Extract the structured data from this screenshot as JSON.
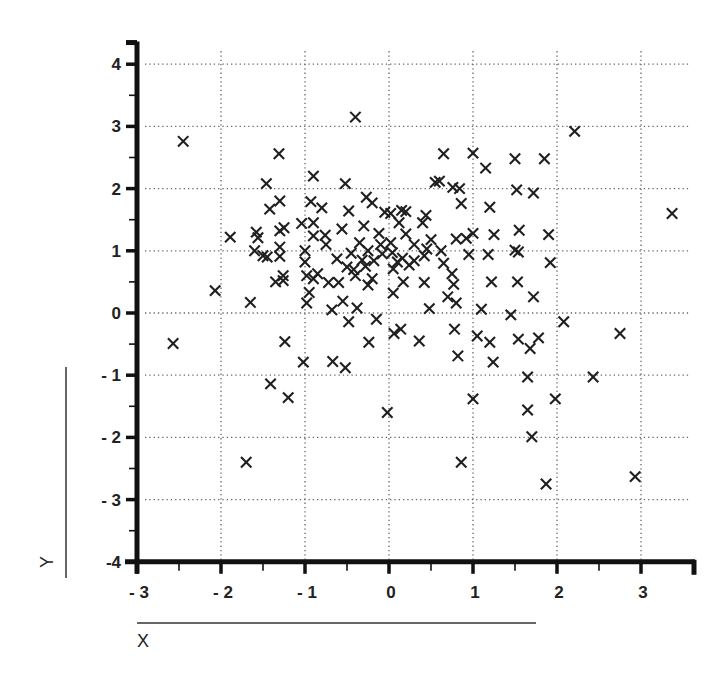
{
  "chart_data": {
    "type": "scatter",
    "title": "",
    "xlabel": "X",
    "ylabel": "Y",
    "xlim": [
      -3,
      3.6
    ],
    "ylim": [
      -4,
      4.3
    ],
    "x_ticks": [
      -3,
      -2,
      -1,
      0,
      1,
      2,
      3
    ],
    "y_ticks": [
      -4,
      -3,
      -2,
      -1,
      0,
      1,
      2,
      3,
      4
    ],
    "x_tick_labels": [
      "- 3",
      "- 2",
      "- 1",
      "0",
      "1",
      "2",
      "3"
    ],
    "y_tick_labels": [
      "-4",
      "- 3",
      "- 2",
      "- 1",
      "0",
      "1",
      "2",
      "3",
      "4"
    ],
    "grid": true,
    "grid_style": "dotted",
    "marker": "x",
    "legend": null,
    "points": [
      [
        -2.45,
        2.76
      ],
      [
        -2.57,
        -0.49
      ],
      [
        -2.07,
        0.36
      ],
      [
        -1.89,
        1.22
      ],
      [
        -1.65,
        0.17
      ],
      [
        -1.7,
        -2.4
      ],
      [
        -1.6,
        1.0
      ],
      [
        -1.58,
        1.3
      ],
      [
        -1.56,
        1.21
      ],
      [
        -1.5,
        0.92
      ],
      [
        -1.45,
        0.9
      ],
      [
        -1.46,
        2.08
      ],
      [
        -1.42,
        1.67
      ],
      [
        -1.41,
        -1.14
      ],
      [
        -1.31,
        2.56
      ],
      [
        -1.3,
        1.8
      ],
      [
        -1.3,
        1.32
      ],
      [
        -1.3,
        1.06
      ],
      [
        -1.3,
        0.91
      ],
      [
        -1.35,
        0.5
      ],
      [
        -1.26,
        0.6
      ],
      [
        -1.25,
        1.37
      ],
      [
        -1.26,
        0.52
      ],
      [
        -1.24,
        -0.46
      ],
      [
        -1.2,
        -1.36
      ],
      [
        -1.04,
        1.44
      ],
      [
        -1.02,
        -0.79
      ],
      [
        -1.0,
        1.0
      ],
      [
        -1.0,
        0.82
      ],
      [
        -0.98,
        0.6
      ],
      [
        -0.98,
        0.16
      ],
      [
        -0.95,
        0.33
      ],
      [
        -0.93,
        1.79
      ],
      [
        -0.9,
        2.2
      ],
      [
        -0.9,
        1.45
      ],
      [
        -0.9,
        1.24
      ],
      [
        -0.9,
        0.55
      ],
      [
        -0.85,
        0.63
      ],
      [
        -0.8,
        1.69
      ],
      [
        -0.76,
        1.25
      ],
      [
        -0.72,
        0.49
      ],
      [
        -0.68,
        0.05
      ],
      [
        -0.67,
        -0.78
      ],
      [
        -0.62,
        0.87
      ],
      [
        -0.6,
        0.49
      ],
      [
        -0.56,
        1.35
      ],
      [
        -0.55,
        0.19
      ],
      [
        -0.52,
        2.08
      ],
      [
        -0.52,
        -0.88
      ],
      [
        -0.5,
        0.74
      ],
      [
        -0.48,
        1.64
      ],
      [
        -0.48,
        -0.14
      ],
      [
        -0.45,
        0.96
      ],
      [
        -0.42,
        0.7
      ],
      [
        -0.4,
        3.15
      ],
      [
        -0.38,
        0.08
      ],
      [
        -0.35,
        1.13
      ],
      [
        -0.32,
        0.85
      ],
      [
        -0.3,
        1.4
      ],
      [
        -0.28,
        0.75
      ],
      [
        -0.27,
        1.86
      ],
      [
        -0.25,
        1.0
      ],
      [
        -0.25,
        0.45
      ],
      [
        -0.24,
        -0.47
      ],
      [
        -0.2,
        1.77
      ],
      [
        -0.2,
        0.55
      ],
      [
        -0.18,
        0.84
      ],
      [
        -0.15,
        -0.1
      ],
      [
        -0.12,
        1.28
      ],
      [
        -0.08,
        0.95
      ],
      [
        -0.05,
        1.62
      ],
      [
        -0.02,
        -1.6
      ],
      [
        0.02,
        1.6
      ],
      [
        0.02,
        1.13
      ],
      [
        0.04,
        0.97
      ],
      [
        0.05,
        0.71
      ],
      [
        0.05,
        0.32
      ],
      [
        0.06,
        -0.33
      ],
      [
        0.1,
        0.82
      ],
      [
        0.12,
        1.45
      ],
      [
        0.14,
        -0.26
      ],
      [
        0.16,
        0.88
      ],
      [
        0.17,
        0.5
      ],
      [
        0.2,
        1.63
      ],
      [
        0.2,
        1.27
      ],
      [
        0.24,
        0.77
      ],
      [
        0.3,
        0.84
      ],
      [
        0.36,
        -0.45
      ],
      [
        0.4,
        1.45
      ],
      [
        0.42,
        0.92
      ],
      [
        0.42,
        0.49
      ],
      [
        0.44,
        1.57
      ],
      [
        0.45,
        1.03
      ],
      [
        0.48,
        0.07
      ],
      [
        0.5,
        1.18
      ],
      [
        0.55,
        2.1
      ],
      [
        0.6,
        2.12
      ],
      [
        0.62,
        1.0
      ],
      [
        0.65,
        2.56
      ],
      [
        0.7,
        0.26
      ],
      [
        0.75,
        0.63
      ],
      [
        0.76,
        2.02
      ],
      [
        0.77,
        0.46
      ],
      [
        0.78,
        -0.26
      ],
      [
        0.8,
        1.19
      ],
      [
        0.8,
        0.16
      ],
      [
        0.82,
        -0.69
      ],
      [
        0.84,
        2.0
      ],
      [
        0.86,
        1.76
      ],
      [
        0.86,
        -2.4
      ],
      [
        0.92,
        1.2
      ],
      [
        0.95,
        0.94
      ],
      [
        1.0,
        2.57
      ],
      [
        1.0,
        1.28
      ],
      [
        1.0,
        -1.38
      ],
      [
        1.05,
        -0.37
      ],
      [
        1.1,
        0.06
      ],
      [
        1.15,
        2.33
      ],
      [
        1.18,
        0.94
      ],
      [
        1.2,
        1.7
      ],
      [
        1.2,
        -0.47
      ],
      [
        1.22,
        0.5
      ],
      [
        1.24,
        -0.79
      ],
      [
        1.25,
        1.26
      ],
      [
        1.45,
        -0.03
      ],
      [
        1.5,
        1.01
      ],
      [
        1.5,
        2.48
      ],
      [
        1.52,
        1.98
      ],
      [
        1.53,
        0.5
      ],
      [
        1.54,
        0.98
      ],
      [
        1.54,
        -0.42
      ],
      [
        1.55,
        1.33
      ],
      [
        1.65,
        -1.03
      ],
      [
        1.65,
        -1.56
      ],
      [
        1.68,
        -0.57
      ],
      [
        1.7,
        -1.99
      ],
      [
        1.72,
        1.93
      ],
      [
        1.72,
        0.26
      ],
      [
        1.78,
        -0.4
      ],
      [
        1.85,
        2.48
      ],
      [
        1.87,
        -2.75
      ],
      [
        1.9,
        1.26
      ],
      [
        1.92,
        0.81
      ],
      [
        1.98,
        -1.38
      ],
      [
        2.08,
        -0.14
      ],
      [
        2.21,
        2.92
      ],
      [
        2.43,
        -1.03
      ],
      [
        2.75,
        -0.33
      ],
      [
        2.93,
        -2.63
      ],
      [
        3.37,
        1.6
      ],
      [
        -0.75,
        1.1
      ],
      [
        -0.4,
        0.6
      ],
      [
        0.3,
        1.1
      ],
      [
        0.65,
        0.8
      ],
      [
        -0.1,
        1.1
      ],
      [
        0.15,
        1.65
      ]
    ]
  }
}
